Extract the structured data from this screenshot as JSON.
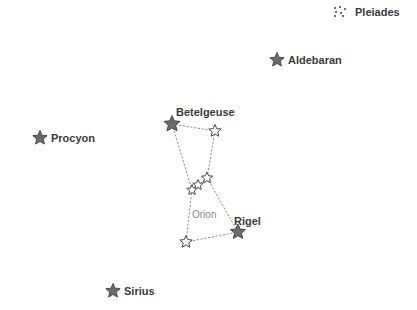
{
  "canvas": {
    "width": 417,
    "height": 310,
    "background": "#ffffff"
  },
  "style": {
    "star_fill": "#6b6b6b",
    "star_stroke": "#4a4a4a",
    "hollow_fill": "#ffffff",
    "line_color": "#8c8c8c",
    "label_color": "#3a3a3a",
    "constellation_label_color": "#8a8a8a"
  },
  "chart_data": {
    "type": "scatter",
    "title": "",
    "xlabel": "",
    "ylabel": "",
    "grid": false,
    "legend": "none",
    "xlim": [
      0,
      417
    ],
    "ylim": [
      0,
      310
    ],
    "stars": [
      {
        "name": "Pleiades",
        "label": "Pleiades",
        "x": 340,
        "y": 12,
        "marker": "cluster",
        "size": 11,
        "labeled": true,
        "label_x": 355,
        "label_y": 7
      },
      {
        "name": "Aldebaran",
        "label": "Aldebaran",
        "x": 277,
        "y": 60,
        "marker": "filled-star",
        "size": 15,
        "labeled": true,
        "label_x": 288,
        "label_y": 55
      },
      {
        "name": "Procyon",
        "label": "Procyon",
        "x": 40,
        "y": 138,
        "marker": "filled-star",
        "size": 15,
        "labeled": true,
        "label_x": 51,
        "label_y": 133
      },
      {
        "name": "Betelgeuse",
        "label": "Betelgeuse",
        "x": 172,
        "y": 124,
        "marker": "filled-star",
        "size": 17,
        "labeled": true,
        "label_x": 176,
        "label_y": 107
      },
      {
        "name": "Bellatrix",
        "label": "",
        "x": 215,
        "y": 131,
        "marker": "hollow-star",
        "size": 13,
        "labeled": false
      },
      {
        "name": "Alnitak",
        "label": "",
        "x": 207,
        "y": 178,
        "marker": "hollow-star",
        "size": 12,
        "labeled": false
      },
      {
        "name": "Alnilam",
        "label": "",
        "x": 198,
        "y": 185,
        "marker": "hollow-star",
        "size": 11,
        "labeled": false
      },
      {
        "name": "Mintaka",
        "label": "",
        "x": 192,
        "y": 190,
        "marker": "hollow-star",
        "size": 11,
        "labeled": false
      },
      {
        "name": "Saiph",
        "label": "",
        "x": 186,
        "y": 242,
        "marker": "hollow-star",
        "size": 13,
        "labeled": false
      },
      {
        "name": "Rigel",
        "label": "Rigel",
        "x": 238,
        "y": 232,
        "marker": "filled-star",
        "size": 16,
        "labeled": true,
        "label_x": 234,
        "label_y": 216
      },
      {
        "name": "Sirius",
        "label": "Sirius",
        "x": 113,
        "y": 291,
        "marker": "filled-star",
        "size": 15,
        "labeled": true,
        "label_x": 124,
        "label_y": 286
      }
    ],
    "constellations": [
      {
        "name": "Orion",
        "label": "Orion",
        "label_x": 192,
        "label_y": 210,
        "line_style": "dotted",
        "segments": [
          [
            "Betelgeuse",
            "Bellatrix"
          ],
          [
            "Betelgeuse",
            "Mintaka"
          ],
          [
            "Bellatrix",
            "Alnitak"
          ],
          [
            "Alnitak",
            "Rigel"
          ],
          [
            "Mintaka",
            "Saiph"
          ],
          [
            "Saiph",
            "Rigel"
          ],
          [
            "Mintaka",
            "Alnilam"
          ],
          [
            "Alnilam",
            "Alnitak"
          ]
        ]
      }
    ],
    "cluster_dots": {
      "Pleiades": [
        {
          "dx": -5,
          "dy": -4
        },
        {
          "dx": 0,
          "dy": -5
        },
        {
          "dx": 5,
          "dy": -3
        },
        {
          "dx": -4,
          "dy": 0
        },
        {
          "dx": 1,
          "dy": 1
        },
        {
          "dx": -5,
          "dy": 4
        },
        {
          "dx": 3,
          "dy": 4
        }
      ]
    }
  },
  "labels": {
    "pleiades": "Pleiades",
    "aldebaran": "Aldebaran",
    "procyon": "Procyon",
    "betelgeuse": "Betelgeuse",
    "rigel": "Rigel",
    "sirius": "Sirius",
    "orion": "Orion"
  }
}
